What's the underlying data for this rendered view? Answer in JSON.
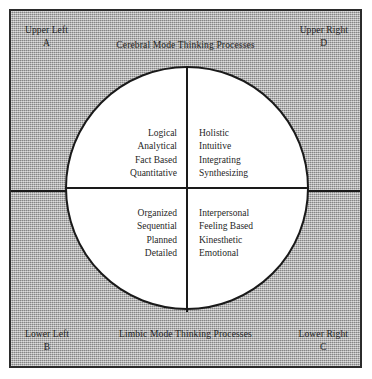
{
  "diagram": {
    "edge_labels": {
      "top": "Cerebral Mode Thinking Processes",
      "bottom": "Limbic Mode Thinking Processes",
      "left": "Left Mode Thinking Processes",
      "right": "Right Mode Thinking Processes"
    },
    "corners": {
      "upper_left": {
        "position": "Upper Left",
        "letter": "A"
      },
      "upper_right": {
        "position": "Upper Right",
        "letter": "D"
      },
      "lower_left": {
        "position": "Lower Left",
        "letter": "B"
      },
      "lower_right": {
        "position": "Lower Right",
        "letter": "C"
      }
    },
    "quadrants": {
      "a_upper_left": {
        "letter": "A",
        "traits": [
          "Logical",
          "Analytical",
          "Fact Based",
          "Quantitative"
        ]
      },
      "d_upper_right": {
        "letter": "D",
        "traits": [
          "Holistic",
          "Intuitive",
          "Integrating",
          "Synthesizing"
        ]
      },
      "b_lower_left": {
        "letter": "B",
        "traits": [
          "Organized",
          "Sequential",
          "Planned",
          "Detailed"
        ]
      },
      "c_lower_right": {
        "letter": "C",
        "traits": [
          "Interpersonal",
          "Feeling Based",
          "Kinesthetic",
          "Emotional"
        ]
      }
    },
    "colors": {
      "background": "#a9a9a9",
      "circle_fill": "#ffffff",
      "line": "#1a1a1a",
      "text": "#1f1f1f",
      "frame_border": "#2b2b2b"
    }
  }
}
